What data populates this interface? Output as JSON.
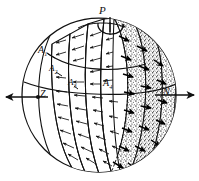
{
  "figure": {
    "background_color": "#ffffff",
    "ink_color": "#111111",
    "stipple_color": "#8d8d8d",
    "sphere": {
      "center_x": 99,
      "center_y": 95,
      "radius_x": 77,
      "radius_y": 77
    }
  },
  "labels": {
    "pole": "P",
    "left_axis": "Z",
    "right_axis": "N",
    "band_1": "A",
    "band_1_sub": "1",
    "band_2": "A",
    "band_2_sub": "2",
    "band_3": "A",
    "band_3_sub": "3",
    "band_4": "A",
    "band_4_sub": "4"
  },
  "annotations": {
    "rotation_arrow": "counterclockwise spin arrow about polar axis P",
    "left_arrow": "leftward arrow through Z",
    "right_arrow": "rightward arrow through N",
    "thin_arrows_direction": "left (toward Z)",
    "thick_arrows_direction": "right-down (toward N)",
    "shaded_bands_count": 3,
    "clear_bands_count": 4
  }
}
